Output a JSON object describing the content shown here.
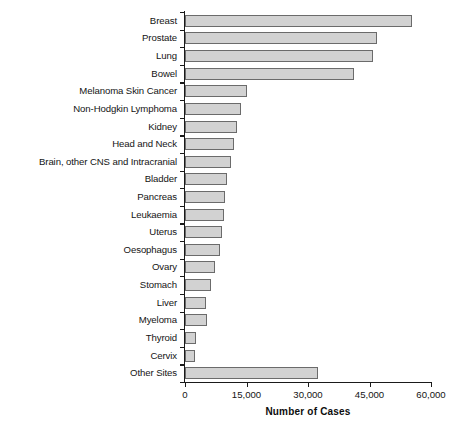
{
  "chart_data": {
    "type": "bar",
    "orientation": "horizontal",
    "title": "",
    "xlabel": "Number of Cases",
    "ylabel": "",
    "xlim": [
      0,
      60000
    ],
    "xticks": [
      0,
      15000,
      30000,
      45000,
      60000
    ],
    "xtick_labels": [
      "0",
      "15,000",
      "30,000",
      "45,000",
      "60,000"
    ],
    "grid": false,
    "legend": null,
    "bar_fill_color": "#d2d2d2",
    "bar_edge_color": "#6b6b6b",
    "categories": [
      "Breast",
      "Prostate",
      "Lung",
      "Bowel",
      "Melanoma Skin Cancer",
      "Non-Hodgkin Lymphoma",
      "Kidney",
      "Head and Neck",
      "Brain, other CNS and Intracranial",
      "Bladder",
      "Pancreas",
      "Leukaemia",
      "Uterus",
      "Oesophagus",
      "Ovary",
      "Stomach",
      "Liver",
      "Myeloma",
      "Thyroid",
      "Cervix",
      "Other Sites"
    ],
    "values": [
      55400,
      46800,
      45900,
      41200,
      15100,
      13700,
      12700,
      12000,
      11200,
      10200,
      9800,
      9500,
      9000,
      8500,
      7300,
      6300,
      5100,
      5400,
      2700,
      2500,
      32400
    ]
  }
}
